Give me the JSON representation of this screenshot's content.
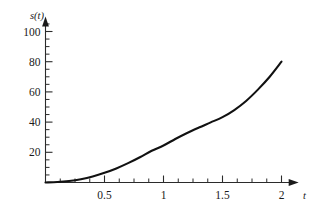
{
  "chart_data": {
    "type": "line",
    "title": "",
    "subtitle": "",
    "xlabel": "t",
    "ylabel": "s(t)",
    "xlim": [
      0,
      2.12
    ],
    "ylim": [
      0,
      108
    ],
    "grid": false,
    "legend": null,
    "x_ticks": [
      {
        "value": 0.5,
        "label": "0.5"
      },
      {
        "value": 1,
        "label": "1"
      },
      {
        "value": 1.5,
        "label": "1.5"
      },
      {
        "value": 2,
        "label": "2"
      }
    ],
    "y_ticks": [
      {
        "value": 20,
        "label": "20"
      },
      {
        "value": 40,
        "label": "40"
      },
      {
        "value": 60,
        "label": "60"
      },
      {
        "value": 80,
        "label": "80"
      },
      {
        "value": 100,
        "label": "100"
      }
    ],
    "x_minor_tick_step": 0.125,
    "y_minor_tick_step": 5,
    "axis_arrows": {
      "x": true,
      "y": true
    },
    "series": [
      {
        "name": "s(t)",
        "color": "#111111",
        "x": [
          0,
          0.1,
          0.2,
          0.3,
          0.4,
          0.5,
          0.6,
          0.7,
          0.8,
          0.9,
          1.0,
          1.1,
          1.2,
          1.3,
          1.4,
          1.5,
          1.6,
          1.7,
          1.8,
          1.9,
          2.0
        ],
        "y": [
          0,
          0.3,
          1.0,
          2.2,
          4.0,
          6.4,
          9.3,
          12.8,
          16.7,
          21.0,
          24.5,
          28.8,
          32.8,
          36.4,
          39.8,
          43.3,
          48.0,
          54.0,
          61.5,
          70.0,
          80.0
        ]
      }
    ]
  },
  "axis_labels": {
    "y_axis_name": "s(t)",
    "x_axis_name": "t"
  }
}
